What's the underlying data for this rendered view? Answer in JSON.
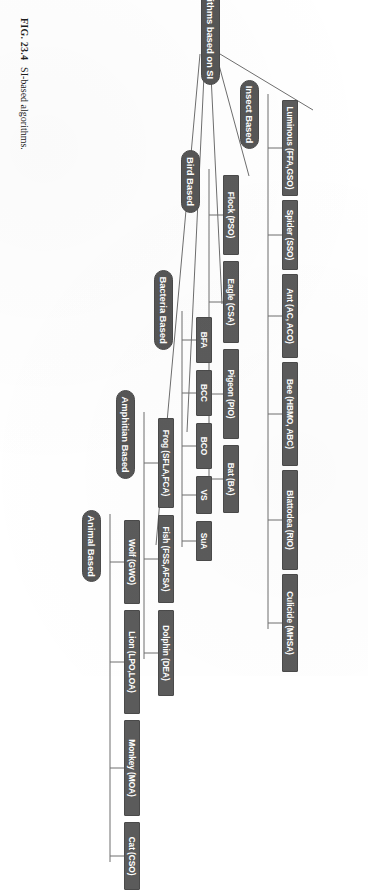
{
  "figure": {
    "caption_number": "FIG. 23.4",
    "caption_text": "SI-based algorithms."
  },
  "colors": {
    "node_fill": "#565656",
    "leaf_fill": "#5b5b5b",
    "node_text": "#ffffff",
    "connector": "#6e6e6e",
    "page_background": "#ffffff",
    "caption_text": "#1d1d1d"
  },
  "tree": {
    "root": {
      "label": "Algorithms based on SI"
    },
    "categories": [
      {
        "id": "insect",
        "label": "Insect Based",
        "children": [
          {
            "label": "Luminous (FFA,GSO)"
          },
          {
            "label": "Spider (SSO)"
          },
          {
            "label": "Ant (AC, ACO)"
          },
          {
            "label": "Bee (HBMO, ABC)"
          },
          {
            "label": "Blattodea (RIO)"
          },
          {
            "label": "Culicide (MHSA)"
          }
        ]
      },
      {
        "id": "bird",
        "label": "Bird Based",
        "children": [
          {
            "label": "Flock (PSO)"
          },
          {
            "label": "Eagle (CSA)"
          },
          {
            "label": "Pigeon (PIO)"
          },
          {
            "label": "Bat (BA)"
          }
        ]
      },
      {
        "id": "bacteria",
        "label": "Bacteria Based",
        "children": [
          {
            "label": "BFA"
          },
          {
            "label": "BCC"
          },
          {
            "label": "BCO"
          },
          {
            "label": "VS"
          },
          {
            "label": "SuA"
          }
        ]
      },
      {
        "id": "amphitian",
        "label": "Amphitian Based",
        "children": [
          {
            "label": "Frog (SFLA,FCA)"
          },
          {
            "label": "Fish (FSS,AFSA)"
          },
          {
            "label": "Dolphin (DEA)"
          }
        ]
      },
      {
        "id": "animal",
        "label": "Animal Based",
        "children": [
          {
            "label": "Wolf (GWO)"
          },
          {
            "label": "Lion (LPO,LOA)"
          },
          {
            "label": "Monkey (MOA)"
          },
          {
            "label": "Cat (CSO)"
          }
        ]
      }
    ]
  }
}
